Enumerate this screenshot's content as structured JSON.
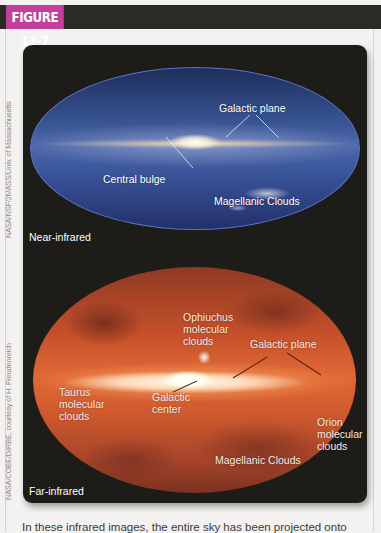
{
  "figure": {
    "label": "FIGURE 12-7",
    "accent_color": "#c2409a",
    "header_bar_color": "#2b2a27"
  },
  "credits": {
    "near_infrared": "NASA/NSF/2MASS/Univ. of Massachusetts",
    "far_infrared": "NASA/COBE/DIRBE, courtesy of H. Freudenreich"
  },
  "panels": {
    "near_infrared": {
      "band_label": "Near-infrared",
      "annotations": {
        "galactic_plane": "Galactic plane",
        "central_bulge": "Central bulge",
        "magellanic_clouds": "Magellanic Clouds"
      }
    },
    "far_infrared": {
      "band_label": "Far-infrared",
      "annotations": {
        "ophiuchus_l1": "Ophiuchus",
        "ophiuchus_l2": "molecular",
        "ophiuchus_l3": "clouds",
        "galactic_plane": "Galactic plane",
        "taurus_l1": "Taurus",
        "taurus_l2": "molecular",
        "taurus_l3": "clouds",
        "galactic_center_l1": "Galactic",
        "galactic_center_l2": "center",
        "orion_l1": "Orion",
        "orion_l2": "molecular",
        "orion_l3": "clouds",
        "magellanic_clouds": "Magellanic Clouds"
      }
    }
  },
  "caption": {
    "text": "In these infrared images, the entire sky has been projected onto"
  }
}
